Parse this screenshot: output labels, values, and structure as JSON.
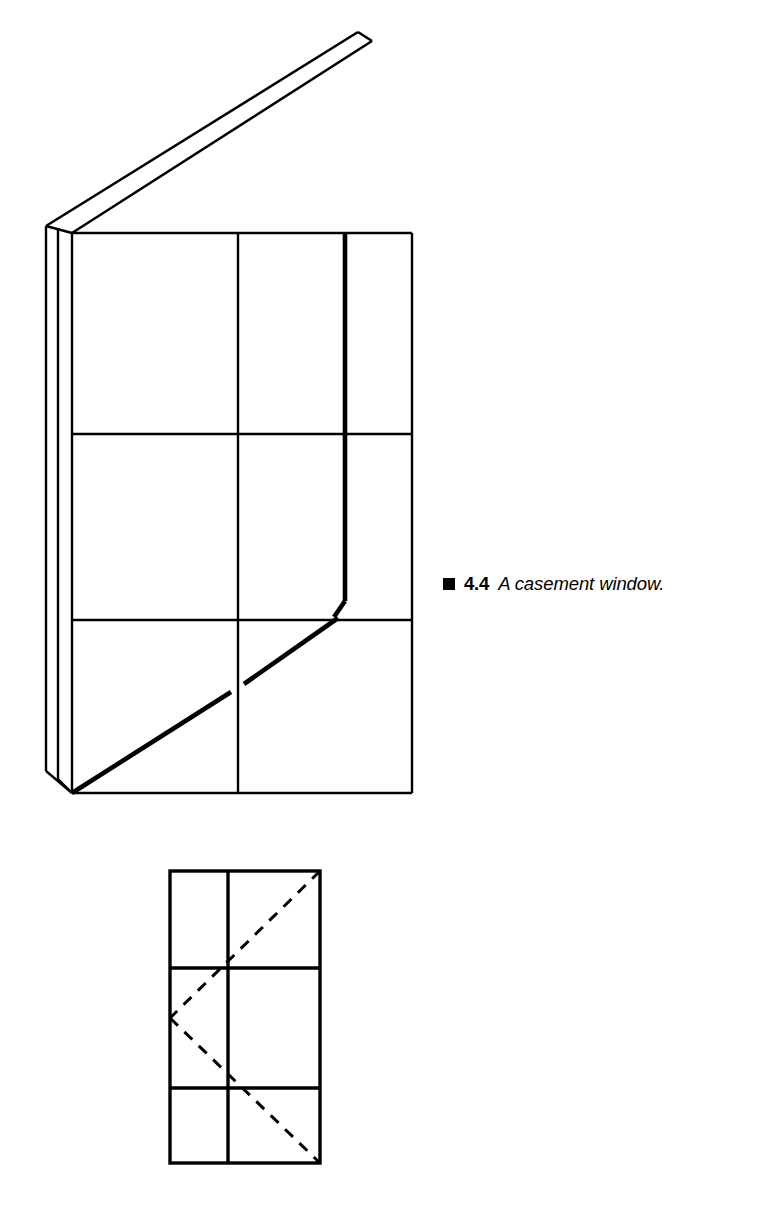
{
  "figure": {
    "caption": {
      "bullet": "filled-square",
      "number": "4.4",
      "text": "A casement window."
    },
    "colors": {
      "ink": "#000000",
      "paper": "#ffffff"
    },
    "axonometric": {
      "name": "axonometric-casement-window",
      "description": "Three-dimensional view of a casement window with the sash swung open",
      "frame": {
        "left": 72,
        "right": 412,
        "top": 233,
        "bottom": 793,
        "vertical_mullion_x": 238,
        "horizontal_mullion_y": [
          434,
          620
        ],
        "panes": 6
      },
      "jamb": {
        "outer_edge_x": 46,
        "top_y": 226,
        "bottom_y": 777,
        "thickness_px": 26
      },
      "open_sash": {
        "apex_x": 358,
        "apex_y": 32,
        "free_edge_x": 345,
        "free_edge_top_y": 233,
        "free_edge_bottom_y": 612,
        "hinge_corner_x": 72,
        "hinge_corner_y": 793,
        "fold_end_x": 345,
        "fold_end_y": 620,
        "slab_thickness_px": 13
      },
      "line_weights": {
        "frame": 2.2,
        "mullion": 2.2,
        "sash_edge": 4.6,
        "fold": 4.6
      }
    },
    "elevation": {
      "name": "elevation-casement-window-swing-diagram",
      "description": "Flat elevation of the same window with dashed swing-direction lines forming a V that points to the hinge side",
      "frame": {
        "left": 170,
        "right": 320,
        "top": 871,
        "bottom": 1163,
        "vertical_mullion_x": 228,
        "horizontal_mullion_y": [
          968,
          1088
        ],
        "panes": 6
      },
      "swing_indicator": {
        "style": "dashed",
        "apex_x": 170,
        "apex_y": 1018,
        "upper_arm_end_x": 320,
        "upper_arm_end_y": 871,
        "lower_arm_end_x": 320,
        "lower_arm_end_y": 1163,
        "dash_pattern": "11 9",
        "line_weight": 3.0
      },
      "line_weights": {
        "frame": 3.4,
        "mullion": 3.4
      }
    }
  }
}
